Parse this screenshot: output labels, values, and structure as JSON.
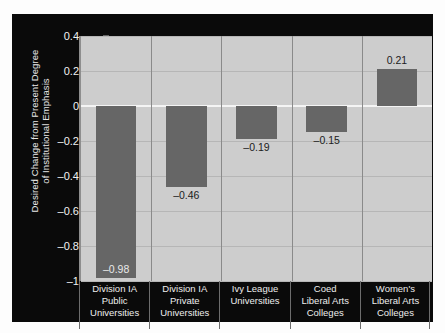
{
  "chart_data": {
    "type": "bar",
    "title": "",
    "xlabel": "",
    "ylabel": "Desired Change from Present Degree of Institutional Emphasis",
    "ylabel_line1": "Desired Change from Present Degree",
    "ylabel_line2": "of Institutional Emphasis",
    "categories": [
      "Division IA Public Universities",
      "Division IA Private Universities",
      "Ivy League Universities",
      "Coed Liberal Arts Colleges",
      "Women's Liberal Arts Colleges"
    ],
    "category_lines": [
      [
        "Division IA",
        "Public",
        "Universities"
      ],
      [
        "Division IA",
        "Private",
        "Universities"
      ],
      [
        "Ivy League",
        "Universities"
      ],
      [
        "Coed",
        "Liberal Arts",
        "Colleges"
      ],
      [
        "Women's",
        "Liberal Arts",
        "Colleges"
      ]
    ],
    "values": [
      -0.98,
      -0.46,
      -0.19,
      -0.15,
      0.21
    ],
    "value_labels": [
      "–0.98",
      "–0.46",
      "–0.19",
      "–0.15",
      "0.21"
    ],
    "ylim": [
      -1,
      0.4
    ],
    "yticks": [
      0.4,
      0.2,
      0,
      -0.2,
      -0.4,
      -0.6,
      -0.8,
      -1
    ],
    "ytick_labels": [
      "0.4",
      "0.2",
      "0",
      "–0.2",
      "–0.4",
      "–0.6",
      "–0.8",
      "–1"
    ],
    "grid": true,
    "legend": "none",
    "colors": {
      "bar": "#666666",
      "plot_background": "#cdcdcd",
      "panel_background": "#0a0a0a",
      "gridline": "#b6b6b6",
      "zeroline": "#f4f4f4",
      "axis_text": "#f2f2f2"
    }
  }
}
